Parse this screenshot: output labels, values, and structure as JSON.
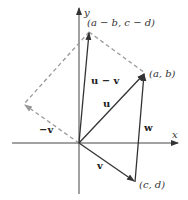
{
  "diagram": {
    "axes": {
      "x_label": "x",
      "y_label": "y"
    },
    "points": {
      "u_minus_v_tip": "(a − b, c − d)",
      "u_tip": "(a, b)",
      "v_tip": "(c, d)"
    },
    "vectors": {
      "u": "u",
      "v": "v",
      "neg_v": "−v",
      "u_minus_v": "u − v",
      "w": "w"
    },
    "colors": {
      "solid": "#333333",
      "dashed": "#999999",
      "background": "#ffffff"
    }
  }
}
